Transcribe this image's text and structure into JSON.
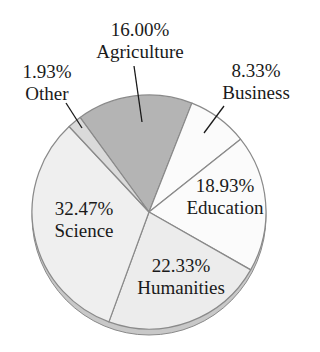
{
  "chart_data": {
    "type": "pie",
    "title": "",
    "start_angle_deg": -36.1,
    "direction": "clockwise",
    "slices": [
      {
        "label": "Agriculture",
        "value": 16.0,
        "display": "16.00%",
        "color": "#b4b4b4"
      },
      {
        "label": "Business",
        "value": 8.33,
        "display": "8.33%",
        "color": "#fbfbfb"
      },
      {
        "label": "Education",
        "value": 18.93,
        "display": "18.93%",
        "color": "#fbfbfb"
      },
      {
        "label": "Humanities",
        "value": 22.33,
        "display": "22.33%",
        "color": "#ececec"
      },
      {
        "label": "Science",
        "value": 32.47,
        "display": "32.47%",
        "color": "#efefef"
      },
      {
        "label": "Other",
        "value": 1.93,
        "display": "1.93%",
        "color": "#dadada"
      }
    ],
    "categories": [
      "Agriculture",
      "Business",
      "Education",
      "Humanities",
      "Science",
      "Other"
    ],
    "values": [
      16.0,
      8.33,
      18.93,
      22.33,
      32.47,
      1.93
    ],
    "edge_color": "#8a8a8a",
    "leader_color": "#1a1a1a"
  },
  "labels": {
    "agriculture": {
      "pct": "16.00%",
      "name": "Agriculture"
    },
    "business": {
      "pct": "8.33%",
      "name": "Business"
    },
    "education": {
      "pct": "18.93%",
      "name": "Education"
    },
    "humanities": {
      "pct": "22.33%",
      "name": "Humanities"
    },
    "science": {
      "pct": "32.47%",
      "name": "Science"
    },
    "other": {
      "pct": "1.93%",
      "name": "Other"
    }
  }
}
